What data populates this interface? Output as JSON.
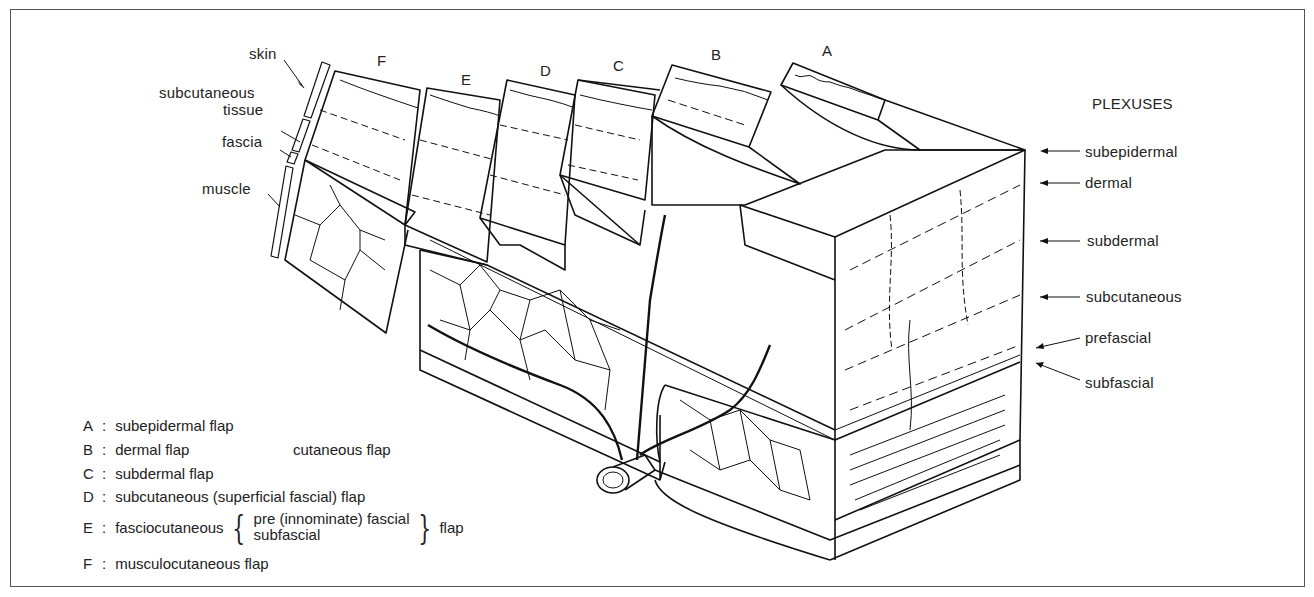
{
  "flap_letters": {
    "A": "A",
    "B": "B",
    "C": "C",
    "D": "D",
    "E": "E",
    "F": "F"
  },
  "tissue_labels": {
    "skin": "skin",
    "subcutaneous_line1": "subcutaneous",
    "subcutaneous_line2": "tissue",
    "fascia": "fascia",
    "muscle": "muscle"
  },
  "plexuses": {
    "title": "PLEXUSES",
    "items": [
      "subepidermal",
      "dermal",
      "subdermal",
      "subcutaneous",
      "prefascial",
      "subfascial"
    ]
  },
  "legend": {
    "separator": ":",
    "items": [
      {
        "key": "A",
        "text": "subepidermal flap"
      },
      {
        "key": "B",
        "text": "dermal flap",
        "group_label": "cutaneous flap"
      },
      {
        "key": "C",
        "text": "subdermal flap"
      },
      {
        "key": "D",
        "text": "subcutaneous (superficial fascial) flap"
      },
      {
        "key": "E",
        "text": "fasciocutaneous",
        "options": [
          "pre (innominate) fascial",
          "subfascial"
        ],
        "suffix": "flap"
      },
      {
        "key": "F",
        "text": "musculocutaneous flap"
      }
    ]
  },
  "colors": {
    "line": "#111111",
    "frame": "#555555",
    "background": "#ffffff"
  }
}
